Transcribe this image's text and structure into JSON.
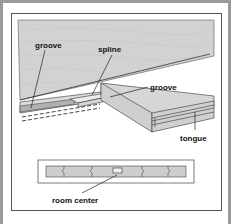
{
  "diagram": {
    "labels": {
      "groove_left": "groove",
      "spline": "spline",
      "groove_right": "groove",
      "tongue": "tongue",
      "room_center": "room center"
    },
    "colors": {
      "board_fill": "#cfcfcf",
      "board_light": "#dedede",
      "groove_fill": "#b5b5b5",
      "outline": "#333333",
      "frame": "#9a9a9a"
    }
  }
}
